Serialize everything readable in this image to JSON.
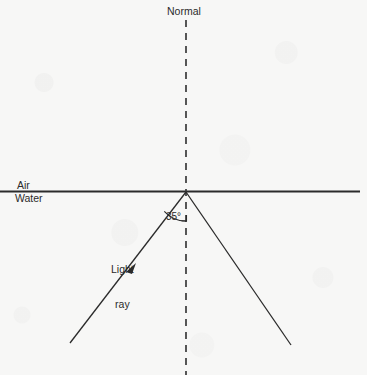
{
  "diagram": {
    "type": "optics-ray-diagram",
    "canvas": {
      "width": 367,
      "height": 375
    },
    "background_color": "#f7f7f6",
    "ink_color": "#2b2b2b",
    "labels": {
      "normal": "Normal",
      "air": "Air",
      "water": "Water",
      "angle": "35°",
      "light_ray_line1": "Light",
      "light_ray_line2": "ray"
    },
    "geometry": {
      "interface_line": {
        "x1": 0,
        "y1": 191.5,
        "x2": 360,
        "y2": 191.5,
        "stroke_width": 2
      },
      "normal_line": {
        "x1": 186,
        "y1": 20,
        "x2": 186,
        "y2": 375,
        "dash": "7 6",
        "stroke_width": 1.6
      },
      "incident_ray": {
        "x1": 70,
        "y1": 343,
        "x2": 186,
        "y2": 192,
        "stroke_width": 1.3
      },
      "reflected_ray": {
        "x1": 186,
        "y1": 192,
        "x2": 291,
        "y2": 345,
        "stroke_width": 1.3
      },
      "vertex": {
        "x": 186,
        "y": 192
      },
      "arrowhead": {
        "x": 133,
        "y": 268,
        "direction": "up-right"
      },
      "angle_arc": {
        "cx": 186,
        "cy": 192,
        "radius": 29,
        "from_ray": "incident",
        "to_ray": "normal"
      },
      "angle_tick": {
        "x": 186,
        "y": 221,
        "size": 6
      }
    },
    "measurements": {
      "angle_of_incidence_deg": 35,
      "medium_above": "Air",
      "medium_below": "Water"
    }
  }
}
